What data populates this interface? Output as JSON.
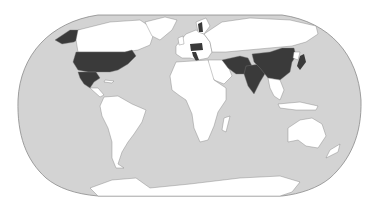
{
  "map": {
    "projection": "Robinson",
    "colors": {
      "ocean": "#d3d3d3",
      "land": "#ffffff",
      "highlight": "#3a3a3a",
      "border": "#7a7a7a",
      "background": "#ffffff"
    },
    "highlighted_regions": [
      "United States",
      "Mexico",
      "Alaska",
      "China",
      "India",
      "Pakistan",
      "Afghanistan",
      "Iran",
      "Japan",
      "Italy",
      "Germany",
      "Poland",
      "Hungary",
      "Sweden"
    ],
    "unhighlighted_regions": [
      "Canada",
      "Greenland",
      "Russia",
      "South America",
      "Africa",
      "Australia",
      "Antarctica",
      "Southeast Asia"
    ]
  }
}
